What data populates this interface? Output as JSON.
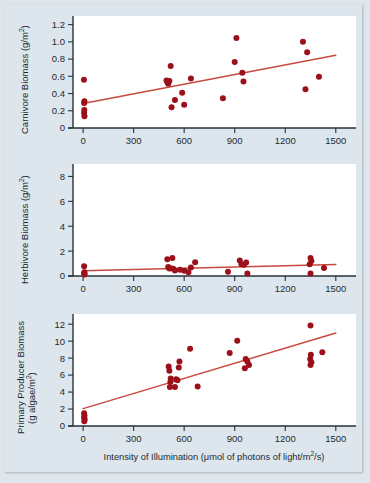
{
  "figure": {
    "background_color": "#dce6ec",
    "point_color": "#9c1019",
    "trend_color": "#c8493f",
    "axis_color": "#26323c",
    "plot_background": "#ffffff",
    "xlabel": "Intensity of Illumination (μmol of photons of light/m²/s)",
    "xlabel_parts": {
      "pre": "Intensity of Illumination (μmol of photons of light/m",
      "sup": "2",
      "post": "/s)"
    }
  },
  "chart_data": [
    {
      "type": "scatter",
      "title": "",
      "panel_id": "carnivore",
      "ylabel": "Carnivore Biomass (g/m²)",
      "ylabel_parts": {
        "pre": "Carnivore Biomass (g/m",
        "sup": "2",
        "post": ")"
      },
      "xlabel": "",
      "xlim": [
        -60,
        1620
      ],
      "ylim": [
        0,
        1.3
      ],
      "xticks": [
        0,
        300,
        600,
        900,
        1200,
        1500
      ],
      "xtick_labels": [
        "0",
        "300",
        "600",
        "900",
        "1200",
        "1500"
      ],
      "yticks": [
        0,
        0.2,
        0.4,
        0.6,
        0.8,
        1.0,
        1.2
      ],
      "ytick_labels": [
        "0",
        "0.2",
        "0.4",
        "0.6",
        "0.8",
        "1.0",
        "1.2"
      ],
      "grid": false,
      "legend": "none",
      "points": [
        [
          5,
          0.56
        ],
        [
          8,
          0.31
        ],
        [
          6,
          0.29
        ],
        [
          7,
          0.21
        ],
        [
          6,
          0.175
        ],
        [
          8,
          0.135
        ],
        [
          495,
          0.55
        ],
        [
          500,
          0.535
        ],
        [
          505,
          0.515
        ],
        [
          512,
          0.545
        ],
        [
          520,
          0.72
        ],
        [
          525,
          0.24
        ],
        [
          545,
          0.325
        ],
        [
          588,
          0.41
        ],
        [
          600,
          0.27
        ],
        [
          640,
          0.575
        ],
        [
          830,
          0.345
        ],
        [
          900,
          0.765
        ],
        [
          910,
          1.045
        ],
        [
          945,
          0.64
        ],
        [
          952,
          0.54
        ],
        [
          1305,
          1.0
        ],
        [
          1330,
          0.88
        ],
        [
          1320,
          0.45
        ],
        [
          1400,
          0.595
        ]
      ],
      "trend": {
        "x": [
          0,
          1500
        ],
        "y": [
          0.285,
          0.845
        ]
      }
    },
    {
      "type": "scatter",
      "title": "",
      "panel_id": "herbivore",
      "ylabel": "Herbivore Biomass (g/m²)",
      "ylabel_parts": {
        "pre": "Herbivore Biomass (g/m",
        "sup": "2",
        "post": ")"
      },
      "xlabel": "",
      "xlim": [
        -60,
        1620
      ],
      "ylim": [
        0,
        9.0
      ],
      "xticks": [
        0,
        300,
        600,
        900,
        1200,
        1500
      ],
      "xtick_labels": [
        "0",
        "300",
        "600",
        "900",
        "1200",
        "1500"
      ],
      "yticks": [
        0,
        2,
        4,
        6,
        8
      ],
      "ytick_labels": [
        "0",
        "2",
        "4",
        "6",
        "8"
      ],
      "grid": false,
      "legend": "none",
      "points": [
        [
          6,
          0.78
        ],
        [
          8,
          0.3
        ],
        [
          6,
          0.22
        ],
        [
          9,
          0.12
        ],
        [
          500,
          1.35
        ],
        [
          530,
          1.45
        ],
        [
          505,
          0.72
        ],
        [
          512,
          0.6
        ],
        [
          520,
          0.62
        ],
        [
          535,
          0.58
        ],
        [
          545,
          0.45
        ],
        [
          575,
          0.5
        ],
        [
          600,
          0.42
        ],
        [
          625,
          0.3
        ],
        [
          640,
          0.68
        ],
        [
          665,
          1.1
        ],
        [
          860,
          0.35
        ],
        [
          930,
          1.25
        ],
        [
          940,
          0.95
        ],
        [
          955,
          0.9
        ],
        [
          968,
          1.08
        ],
        [
          975,
          0.2
        ],
        [
          1350,
          1.45
        ],
        [
          1355,
          1.2
        ],
        [
          1345,
          0.95
        ],
        [
          1350,
          0.2
        ],
        [
          1430,
          0.65
        ]
      ],
      "trend": {
        "x": [
          0,
          1500
        ],
        "y": [
          0.42,
          0.92
        ]
      }
    },
    {
      "type": "scatter",
      "title": "",
      "panel_id": "primary-producer",
      "ylabel": "Primary Producer Biomass (g algae/m²)",
      "ylabel_line1": "Primary Producer Biomass",
      "ylabel_line2_parts": {
        "pre": "(g algae/m",
        "sup": "2",
        "post": ")"
      },
      "xlabel": "Intensity of Illumination (μmol of photons of light/m²/s)",
      "xlim": [
        -60,
        1620
      ],
      "ylim": [
        0,
        13.2
      ],
      "xticks": [
        0,
        300,
        600,
        900,
        1200,
        1500
      ],
      "xtick_labels": [
        "0",
        "300",
        "600",
        "900",
        "1200",
        "1500"
      ],
      "yticks": [
        0,
        2,
        4,
        6,
        8,
        10,
        12
      ],
      "ytick_labels": [
        "0",
        "2",
        "4",
        "6",
        "8",
        "10",
        "12"
      ],
      "grid": false,
      "legend": "none",
      "points": [
        [
          6,
          1.5
        ],
        [
          8,
          1.25
        ],
        [
          6,
          1.0
        ],
        [
          9,
          0.8
        ],
        [
          7,
          0.55
        ],
        [
          508,
          7.0
        ],
        [
          512,
          6.5
        ],
        [
          520,
          5.6
        ],
        [
          518,
          5.2
        ],
        [
          515,
          4.6
        ],
        [
          545,
          4.6
        ],
        [
          552,
          5.5
        ],
        [
          560,
          5.4
        ],
        [
          568,
          6.9
        ],
        [
          572,
          7.6
        ],
        [
          635,
          9.1
        ],
        [
          680,
          4.65
        ],
        [
          870,
          8.6
        ],
        [
          915,
          10.05
        ],
        [
          965,
          7.9
        ],
        [
          975,
          7.6
        ],
        [
          960,
          6.8
        ],
        [
          985,
          7.2
        ],
        [
          1350,
          11.85
        ],
        [
          1352,
          8.4
        ],
        [
          1348,
          7.9
        ],
        [
          1355,
          7.5
        ],
        [
          1350,
          7.2
        ],
        [
          1420,
          8.7
        ]
      ],
      "trend": {
        "x": [
          0,
          1500
        ],
        "y": [
          2.05,
          10.95
        ]
      }
    }
  ]
}
